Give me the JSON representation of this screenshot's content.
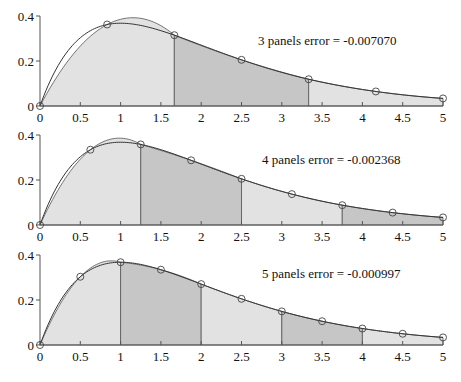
{
  "chart_data": {
    "type": "area",
    "function": "x*exp(-x)",
    "xlim": [
      0,
      5
    ],
    "ylim": [
      0,
      0.4
    ],
    "x_ticks": [
      "0",
      "0.5",
      "1",
      "1.5",
      "2",
      "2.5",
      "3",
      "3.5",
      "4",
      "4.5",
      "5"
    ],
    "y_ticks": [
      "0",
      "0.2",
      "0.4"
    ],
    "grid": false,
    "colors": {
      "light_fill": "#e2e2e2",
      "dark_fill": "#c6c6c6",
      "line": "#333333"
    },
    "panels": [
      {
        "label": "3 panels",
        "error_text": "error = -0.007070",
        "n": 3,
        "boundaries": [
          0,
          1.6667,
          3.3333,
          5
        ],
        "nodes_x": [
          0,
          0.8333,
          1.6667,
          2.5,
          3.3333,
          4.1667,
          5
        ],
        "nodes_y": [
          0,
          0.362,
          0.315,
          0.205,
          0.119,
          0.064,
          0.034
        ]
      },
      {
        "label": "4 panels",
        "error_text": "error = -0.002368",
        "n": 4,
        "boundaries": [
          0,
          1.25,
          2.5,
          3.75,
          5
        ],
        "nodes_x": [
          0,
          0.625,
          1.25,
          1.875,
          2.5,
          3.125,
          3.75,
          4.375,
          5
        ],
        "nodes_y": [
          0,
          0.335,
          0.358,
          0.288,
          0.205,
          0.137,
          0.088,
          0.055,
          0.034
        ]
      },
      {
        "label": "5 panels",
        "error_text": "error = -0.000997",
        "n": 5,
        "boundaries": [
          0,
          1,
          2,
          3,
          4,
          5
        ],
        "nodes_x": [
          0,
          0.5,
          1,
          1.5,
          2,
          2.5,
          3,
          3.5,
          4,
          4.5,
          5
        ],
        "nodes_y": [
          0,
          0.303,
          0.368,
          0.335,
          0.271,
          0.205,
          0.149,
          0.106,
          0.073,
          0.05,
          0.034
        ]
      }
    ]
  },
  "labels": {
    "panel_0": "3 panels   error = -0.007070",
    "panel_1": "4 panels   error = -0.002368",
    "panel_2": "5 panels   error = -0.000997"
  }
}
